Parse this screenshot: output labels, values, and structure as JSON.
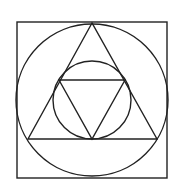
{
  "diagram": {
    "background": "#ffffff",
    "stroke_color": "#222222",
    "shapes": {
      "square": {
        "x": 17,
        "y": 22,
        "width": 150,
        "height": 156
      },
      "outer_circle": {
        "cx": 92,
        "cy": 100,
        "r": 76
      },
      "outer_triangle": {
        "points": "92,23 28,139 157,139"
      },
      "inner_circle": {
        "cx": 92,
        "cy": 100,
        "r": 39
      },
      "inner_triangle": {
        "points": "59,80 125,80 92,139"
      }
    }
  }
}
